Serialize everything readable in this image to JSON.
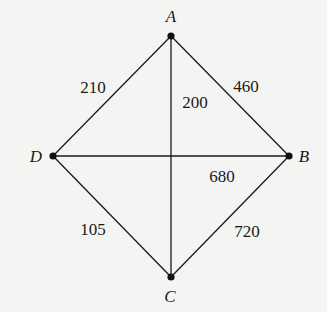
{
  "graph": {
    "type": "weighted-undirected-graph",
    "nodes": [
      {
        "id": "A",
        "label": "A",
        "x": 171,
        "y": 36,
        "lx": 171,
        "ly": 22
      },
      {
        "id": "B",
        "label": "B",
        "x": 289,
        "y": 156,
        "lx": 304,
        "ly": 162
      },
      {
        "id": "C",
        "label": "C",
        "x": 171,
        "y": 277,
        "lx": 170,
        "ly": 302
      },
      {
        "id": "D",
        "label": "D",
        "x": 53,
        "y": 156,
        "lx": 36,
        "ly": 162
      }
    ],
    "edges": [
      {
        "from": "A",
        "to": "D",
        "weight": "210",
        "lx": 93,
        "ly": 93
      },
      {
        "from": "A",
        "to": "C",
        "weight": "200",
        "lx": 195,
        "ly": 108
      },
      {
        "from": "A",
        "to": "B",
        "weight": "460",
        "lx": 246,
        "ly": 92
      },
      {
        "from": "D",
        "to": "B",
        "weight": "680",
        "lx": 222,
        "ly": 182
      },
      {
        "from": "D",
        "to": "C",
        "weight": "105",
        "lx": 93,
        "ly": 235
      },
      {
        "from": "B",
        "to": "C",
        "weight": "720",
        "lx": 247,
        "ly": 237
      }
    ]
  },
  "colors": {
    "background": "#f4f4f2",
    "line": "#1a1a1a",
    "node": "#111111"
  }
}
